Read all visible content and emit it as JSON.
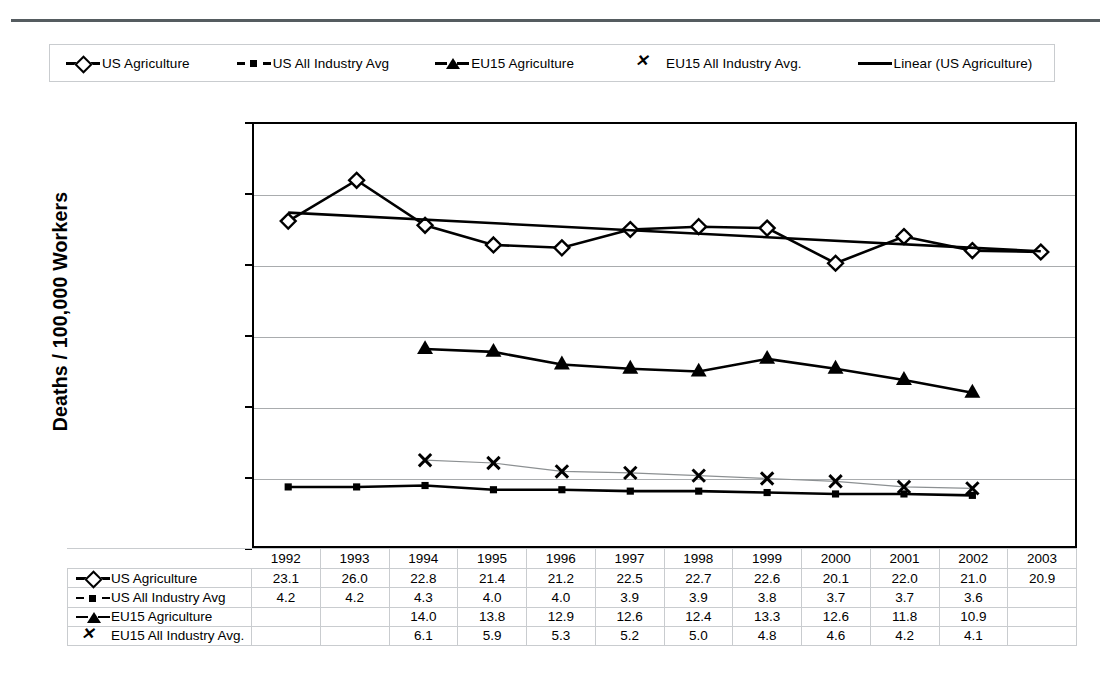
{
  "chart_data": {
    "type": "line",
    "title": "",
    "xlabel": "",
    "ylabel": "Deaths / 100,000 Workers",
    "ylim": [
      0.0,
      30.0
    ],
    "ytick_labels": [
      "30.0",
      "25.0",
      "20.0",
      "15.0",
      "10.0",
      "5.0",
      "0.0"
    ],
    "ytick_values": [
      30.0,
      25.0,
      20.0,
      15.0,
      10.0,
      5.0,
      0.0
    ],
    "grid": true,
    "legend_position": "top",
    "categories": [
      "1992",
      "1993",
      "1994",
      "1995",
      "1996",
      "1997",
      "1998",
      "1999",
      "2000",
      "2001",
      "2002",
      "2003"
    ],
    "series": [
      {
        "name": "US Agriculture",
        "marker": "open-diamond",
        "values": [
          23.1,
          26.0,
          22.8,
          21.4,
          21.2,
          22.5,
          22.7,
          22.6,
          20.1,
          22.0,
          21.0,
          20.9
        ],
        "labels": [
          "23.1",
          "26.0",
          "22.8",
          "21.4",
          "21.2",
          "22.5",
          "22.7",
          "22.6",
          "20.1",
          "22.0",
          "21.0",
          "20.9"
        ]
      },
      {
        "name": "US All Industry Avg",
        "marker": "filled-square",
        "values": [
          4.2,
          4.2,
          4.3,
          4.0,
          4.0,
          3.9,
          3.9,
          3.8,
          3.7,
          3.7,
          3.6,
          null
        ],
        "labels": [
          "4.2",
          "4.2",
          "4.3",
          "4.0",
          "4.0",
          "3.9",
          "3.9",
          "3.8",
          "3.7",
          "3.7",
          "3.6",
          ""
        ]
      },
      {
        "name": "EU15 Agriculture",
        "marker": "filled-triangle",
        "values": [
          null,
          null,
          14.0,
          13.8,
          12.9,
          12.6,
          12.4,
          13.3,
          12.6,
          11.8,
          10.9,
          null
        ],
        "labels": [
          "",
          "",
          "14.0",
          "13.8",
          "12.9",
          "12.6",
          "12.4",
          "13.3",
          "12.6",
          "11.8",
          "10.9",
          ""
        ]
      },
      {
        "name": "EU15 All Industry Avg.",
        "marker": "x",
        "values": [
          null,
          null,
          6.1,
          5.9,
          5.3,
          5.2,
          5.0,
          4.8,
          4.6,
          4.2,
          4.1,
          null
        ],
        "labels": [
          "",
          "",
          "6.1",
          "5.9",
          "5.3",
          "5.2",
          "5.0",
          "4.8",
          "4.6",
          "4.2",
          "4.1",
          ""
        ]
      },
      {
        "name": "Linear (US Agriculture)",
        "marker": "line",
        "trendline": true,
        "values": [
          23.7,
          23.45,
          23.2,
          22.95,
          22.7,
          22.45,
          22.2,
          21.95,
          21.7,
          21.45,
          21.2,
          20.95
        ]
      }
    ]
  },
  "legend": {
    "items": [
      {
        "label": "US Agriculture",
        "marker": "open-diamond"
      },
      {
        "label": "US All Industry Avg",
        "marker": "filled-square"
      },
      {
        "label": "EU15 Agriculture",
        "marker": "filled-triangle"
      },
      {
        "label": "EU15 All Industry Avg.",
        "marker": "x"
      },
      {
        "label": "Linear (US Agriculture)",
        "marker": "line"
      }
    ]
  },
  "axis": {
    "ylabel": "Deaths / 100,000 Workers",
    "yticks": [
      "30.0",
      "25.0",
      "20.0",
      "15.0",
      "10.0",
      "5.0",
      "0.0"
    ]
  },
  "table": {
    "years": [
      "1992",
      "1993",
      "1994",
      "1995",
      "1996",
      "1997",
      "1998",
      "1999",
      "2000",
      "2001",
      "2002",
      "2003"
    ],
    "rows": [
      {
        "label": "US Agriculture",
        "marker": "open-diamond",
        "cells": [
          "23.1",
          "26.0",
          "22.8",
          "21.4",
          "21.2",
          "22.5",
          "22.7",
          "22.6",
          "20.1",
          "22.0",
          "21.0",
          "20.9"
        ]
      },
      {
        "label": "US All Industry Avg",
        "marker": "filled-square",
        "cells": [
          "4.2",
          "4.2",
          "4.3",
          "4.0",
          "4.0",
          "3.9",
          "3.9",
          "3.8",
          "3.7",
          "3.7",
          "3.6",
          ""
        ]
      },
      {
        "label": "EU15 Agriculture",
        "marker": "filled-triangle",
        "cells": [
          "",
          "",
          "14.0",
          "13.8",
          "12.9",
          "12.6",
          "12.4",
          "13.3",
          "12.6",
          "11.8",
          "10.9",
          ""
        ]
      },
      {
        "label": "EU15 All Industry Avg.",
        "marker": "x",
        "cells": [
          "",
          "",
          "6.1",
          "5.9",
          "5.3",
          "5.2",
          "5.0",
          "4.8",
          "4.6",
          "4.2",
          "4.1",
          ""
        ]
      }
    ]
  },
  "colors": {
    "series_line": "#000000",
    "grid": "#a9acae",
    "eu_all_industry_line": "#8c9092",
    "border": "#000000",
    "table_border": "#c9cccf",
    "top_rule": "#555c60"
  }
}
